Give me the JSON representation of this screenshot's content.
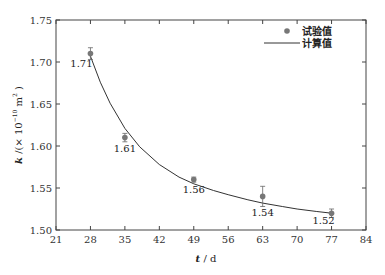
{
  "chart_data": {
    "type": "scatter",
    "title": "",
    "xlabel": "t / d",
    "ylabel": "k /(×10⁻¹⁰ m²)",
    "xlim": [
      21,
      84
    ],
    "ylim": [
      1.5,
      1.75
    ],
    "xticks": [
      21,
      28,
      35,
      42,
      49,
      56,
      63,
      70,
      77,
      84
    ],
    "yticks": [
      1.5,
      1.55,
      1.6,
      1.65,
      1.7,
      1.75
    ],
    "ytick_labels": [
      "1.50",
      "1.55",
      "1.60",
      "1.65",
      "1.70",
      "1.75"
    ],
    "grid": false,
    "legend_position": "upper right",
    "series": [
      {
        "name": "试验值",
        "kind": "scatter-with-errorbars",
        "color": "#777777",
        "points": [
          {
            "x": 28,
            "y": 1.71,
            "err": 0.007,
            "label": "1.71"
          },
          {
            "x": 35,
            "y": 1.61,
            "err": 0.005,
            "label": "1.61"
          },
          {
            "x": 49,
            "y": 1.56,
            "err": 0.003,
            "label": "1.56"
          },
          {
            "x": 63,
            "y": 1.54,
            "err": 0.012,
            "label": "1.54"
          },
          {
            "x": 77,
            "y": 1.52,
            "err": 0.005,
            "label": "1.52"
          }
        ]
      },
      {
        "name": "计算值",
        "kind": "line",
        "color": "#333333",
        "x": [
          28,
          30,
          32,
          35,
          38,
          42,
          46,
          49,
          53,
          56,
          60,
          63,
          67,
          70,
          74,
          77
        ],
        "y": [
          1.707,
          1.676,
          1.651,
          1.621,
          1.599,
          1.578,
          1.563,
          1.555,
          1.547,
          1.542,
          1.536,
          1.532,
          1.528,
          1.525,
          1.522,
          1.52
        ]
      }
    ]
  },
  "legend": {
    "experimental_label": "试验值",
    "calculated_label": "计算值"
  },
  "axes": {
    "x_label_italic": "t",
    "x_label_rest": " / d",
    "y_label_italic": "k",
    "y_label_rest": " /(× 10",
    "y_label_exp": "−10",
    "y_label_unit": " m",
    "y_label_unit_exp": "2",
    "y_label_close": " )"
  }
}
